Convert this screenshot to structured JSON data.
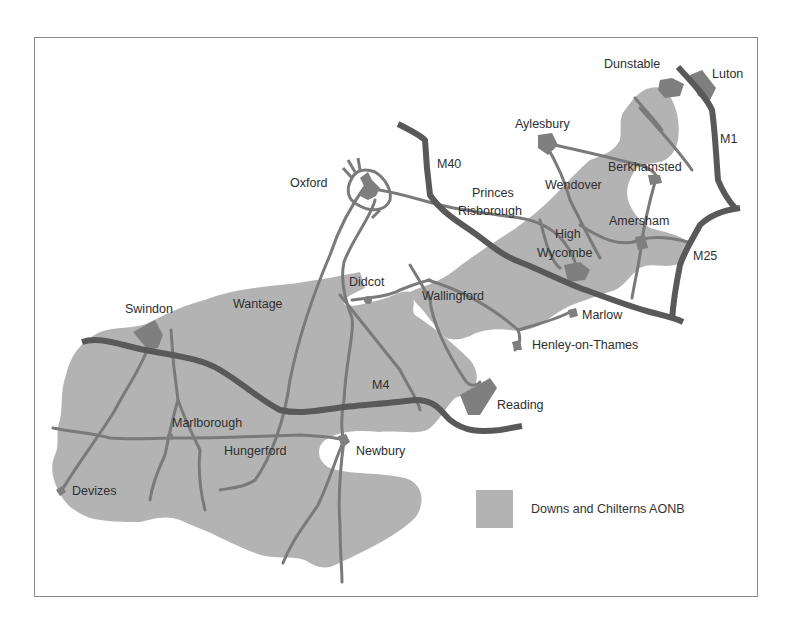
{
  "map": {
    "title": "Downs and Chilterns map",
    "colors": {
      "aonb_fill": "#b3b3b3",
      "town_fill": "#7f7f7f",
      "motorway": "#595959",
      "road": "#7a7a7a",
      "frame": "#8a8a8a",
      "label": "#2e2e2e"
    },
    "towns": [
      {
        "name": "Dunstable"
      },
      {
        "name": "Luton"
      },
      {
        "name": "Aylesbury"
      },
      {
        "name": "Berkhamsted"
      },
      {
        "name": "Oxford"
      },
      {
        "name": "Wendover"
      },
      {
        "name": "Princes Risborough"
      },
      {
        "name": "Amersham"
      },
      {
        "name": "High Wycombe"
      },
      {
        "name": "Didcot"
      },
      {
        "name": "Wallingford"
      },
      {
        "name": "Wantage"
      },
      {
        "name": "Swindon"
      },
      {
        "name": "Marlow"
      },
      {
        "name": "Henley-on-Thames"
      },
      {
        "name": "Reading"
      },
      {
        "name": "Marlborough"
      },
      {
        "name": "Hungerford"
      },
      {
        "name": "Newbury"
      },
      {
        "name": "Devizes"
      }
    ],
    "town_labels": {
      "dunstable": "Dunstable",
      "luton": "Luton",
      "aylesbury": "Aylesbury",
      "berkhamsted": "Berkhamsted",
      "oxford": "Oxford",
      "wendover": "Wendover",
      "princes": "Princes",
      "risborough": "Risborough",
      "amersham": "Amersham",
      "high": "High",
      "wycombe": "Wycombe",
      "didcot": "Didcot",
      "wallingford": "Wallingford",
      "wantage": "Wantage",
      "swindon": "Swindon",
      "marlow": "Marlow",
      "henley": "Henley-on-Thames",
      "reading": "Reading",
      "marlborough": "Marlborough",
      "hungerford": "Hungerford",
      "newbury": "Newbury",
      "devizes": "Devizes"
    },
    "motorways": {
      "m1": "M1",
      "m40": "M40",
      "m25": "M25",
      "m4": "M4"
    },
    "legend": {
      "label": "Downs and Chilterns AONB"
    }
  }
}
